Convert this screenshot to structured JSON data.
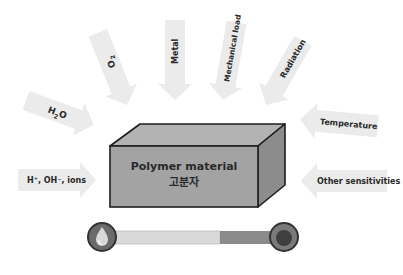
{
  "diagram": {
    "title": "Polymer material",
    "subtitle": "고분자",
    "arrows": [
      {
        "id": "h2o",
        "label_main": "H",
        "label_sub": "2",
        "label_rest": "O"
      },
      {
        "id": "o2",
        "label_main": "O",
        "label_sub": "2"
      },
      {
        "id": "metal",
        "label": "Metal"
      },
      {
        "id": "mechanical",
        "label": "Mechanical load"
      },
      {
        "id": "radiation",
        "label": "Radiation"
      },
      {
        "id": "temperature",
        "label": "Temperature"
      },
      {
        "id": "ions",
        "label": "H⁺, OH⁻, ions"
      },
      {
        "id": "other",
        "label": "Other sensitivities"
      }
    ],
    "scale": {
      "left_icon": "water-drop-icon",
      "right_icon": "dark-circle-icon",
      "light_fraction": 0.62,
      "colors": {
        "bar_light": "#d9d9d9",
        "bar_dark": "#8a8a8a",
        "knob_ring": "#555555",
        "knob_fill": "#6b6b6b",
        "knob_center_dark": "#3f3f3f"
      }
    },
    "colors": {
      "box_front": "#a3a3a3",
      "box_top": "#b3b3b3",
      "box_side": "#8c8c8c",
      "box_outline": "#1e1e1e",
      "arrow_fill": "#ebebeb"
    }
  }
}
